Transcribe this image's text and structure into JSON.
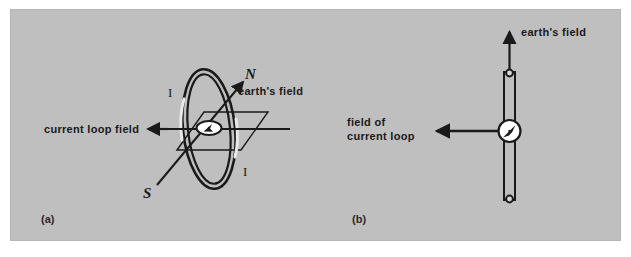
{
  "figure": {
    "background_color": "#bfbfbf",
    "page_color": "#ffffff",
    "ink_color": "#1a1a1a",
    "highlight_color": "#e8e8e8"
  },
  "panel_a": {
    "caption": "(a)",
    "current_loop_field_label": "current  loop  field",
    "earths_field_label": "earth's  field",
    "north_pole_label": "N",
    "south_pole_label": "S",
    "current_label_upper": "I",
    "current_label_lower": "I",
    "description": "Current loop viewed at an angle with a compass at its center, a horizontal plane through the loop, the earth's field axis running from S at lower-left to N at upper-right, and the current loop field arrow pointing left."
  },
  "panel_b": {
    "caption": "(b)",
    "earths_field_label": "earth's  field",
    "field_of_current_loop_line1": "field  of",
    "field_of_current_loop_line2": "current  loop",
    "description": "Vertical magnet bar with a compass at its center; earth's field arrow points up, field of current loop arrow points left."
  }
}
